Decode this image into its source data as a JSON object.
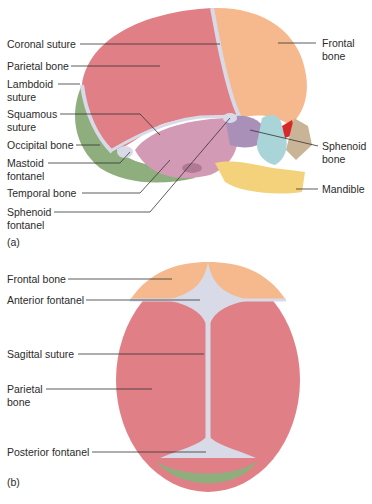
{
  "figure": {
    "panels": [
      {
        "tag": "(a)",
        "view": "lateral",
        "labels_left": [
          {
            "text": "Coronal suture"
          },
          {
            "text": "Parietal bone"
          },
          {
            "line1": "Lambdoid",
            "line2": "suture"
          },
          {
            "line1": "Squamous",
            "line2": "suture"
          },
          {
            "text": "Occipital bone"
          },
          {
            "line1": "Mastoid",
            "line2": "fontanel"
          },
          {
            "text": "Temporal bone"
          },
          {
            "line1": "Sphenoid",
            "line2": "fontanel"
          }
        ],
        "labels_right": [
          {
            "line1": "Frontal",
            "line2": "bone"
          },
          {
            "line1": "Sphenoid",
            "line2": "bone"
          },
          {
            "text": "Mandible"
          }
        ]
      },
      {
        "tag": "(b)",
        "view": "superior",
        "labels_left": [
          {
            "text": "Frontal bone"
          },
          {
            "text": "Anterior fontanel"
          },
          {
            "text": "Sagittal suture"
          },
          {
            "line1": "Parietal",
            "line2": "bone"
          },
          {
            "text": "Posterior fontanel"
          }
        ]
      }
    ],
    "colors": {
      "parietal": "#e07f86",
      "frontal": "#f6b98e",
      "occipital": "#8fae7e",
      "temporal": "#d39ab5",
      "sphenoid": "#a890b8",
      "mandible": "#f4d27c",
      "maxilla": "#a9d4d8",
      "fontanel": "#d9dae8",
      "orbit": "#d62a2a",
      "leader": "#333333"
    }
  }
}
